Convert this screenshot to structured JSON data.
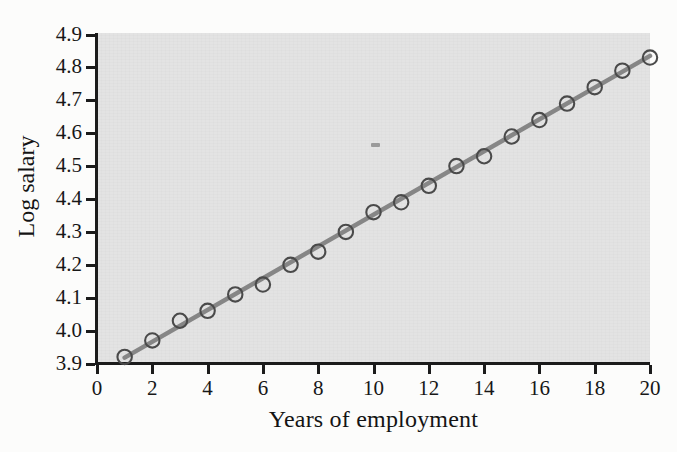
{
  "chart_data": {
    "type": "scatter",
    "title": "",
    "xlabel": "Years of employment",
    "ylabel": "Log salary",
    "xlim": [
      0,
      20
    ],
    "ylim": [
      3.9,
      4.9
    ],
    "xticks": [
      0,
      2,
      4,
      6,
      8,
      10,
      12,
      14,
      16,
      18,
      20
    ],
    "xticklabels": [
      "0",
      "2",
      "4",
      "6",
      "8",
      "10",
      "12",
      "14",
      "16",
      "18",
      "20"
    ],
    "yticks": [
      3.9,
      4.0,
      4.1,
      4.2,
      4.3,
      4.4,
      4.5,
      4.6,
      4.7,
      4.8,
      4.9
    ],
    "yticklabels": [
      "3.9",
      "4.0",
      "4.1",
      "4.2",
      "4.3",
      "4.4",
      "4.5",
      "4.6",
      "4.7",
      "4.8",
      "4.9"
    ],
    "grid": false,
    "legend": false,
    "panel_background": "#e3e3e3",
    "marker": "open-circle",
    "marker_edge_color": "#4a4a4a",
    "marker_face_color": "none",
    "line_color": "#868686",
    "series": [
      {
        "name": "observed",
        "type": "scatter",
        "x": [
          1,
          2,
          3,
          4,
          5,
          6,
          7,
          8,
          9,
          10,
          11,
          12,
          13,
          14,
          15,
          16,
          17,
          18,
          19,
          20
        ],
        "y": [
          3.92,
          3.97,
          4.03,
          4.06,
          4.11,
          4.14,
          4.2,
          4.24,
          4.3,
          4.36,
          4.39,
          4.44,
          4.5,
          4.53,
          4.59,
          4.64,
          4.69,
          4.74,
          4.79,
          4.83
        ]
      },
      {
        "name": "fitted line",
        "type": "line",
        "x": [
          1,
          20
        ],
        "y": [
          3.918,
          4.835
        ]
      }
    ],
    "annotations": [
      {
        "name": "scan-speck",
        "x": 10.05,
        "y": 4.565,
        "text": ""
      }
    ]
  },
  "axes": {
    "x_axis_name": "x-axis",
    "y_axis_name": "y-axis"
  }
}
